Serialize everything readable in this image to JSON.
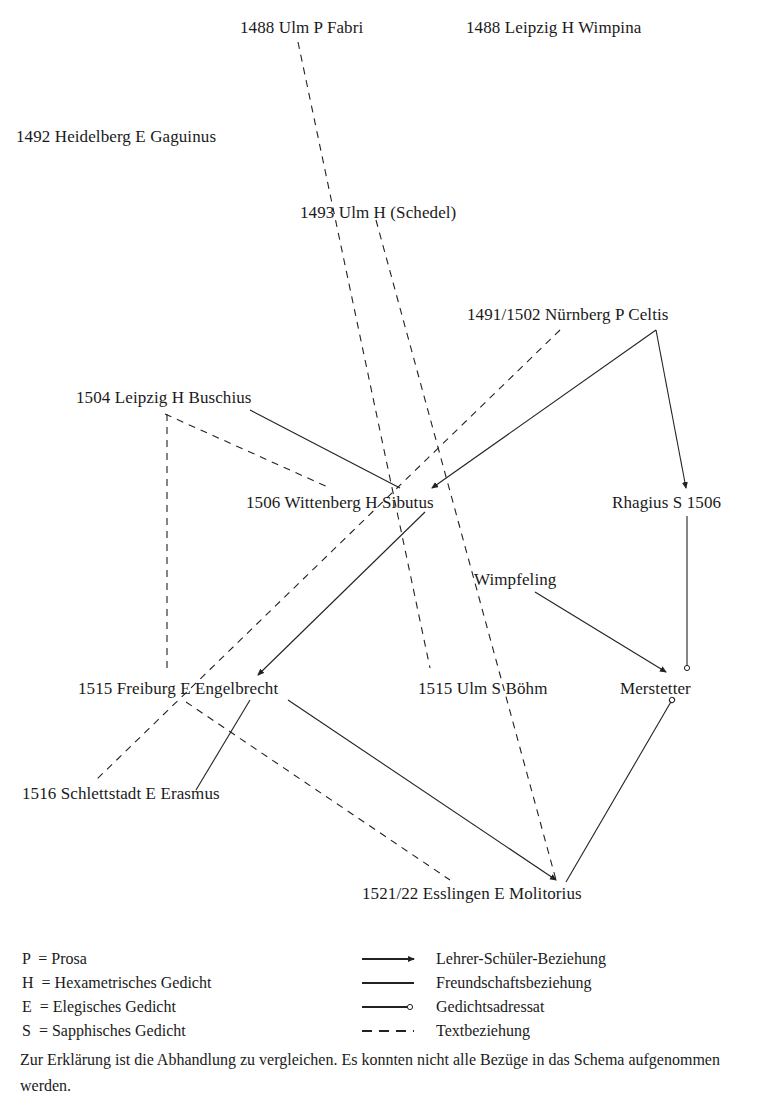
{
  "nodes": [
    {
      "id": "fabri",
      "label": "1488 Ulm P Fabri",
      "x": 240,
      "y": 18
    },
    {
      "id": "wimpina",
      "label": "1488 Leipzig H Wimpina",
      "x": 466,
      "y": 18
    },
    {
      "id": "gaguinus",
      "label": "1492 Heidelberg E Gaguinus",
      "x": 16,
      "y": 127
    },
    {
      "id": "schedel",
      "label": "1493 Ulm H (Schedel)",
      "x": 300,
      "y": 203
    },
    {
      "id": "celtis",
      "label": "1491/1502 Nürnberg P Celtis",
      "x": 467,
      "y": 305
    },
    {
      "id": "buschius",
      "label": "1504 Leipzig H Buschius",
      "x": 76,
      "y": 388
    },
    {
      "id": "sibutus",
      "label": "1506 Wittenberg H Sibutus",
      "x": 246,
      "y": 493
    },
    {
      "id": "rhagius",
      "label": "Rhagius S 1506",
      "x": 612,
      "y": 493
    },
    {
      "id": "wimpfeling",
      "label": "Wimpfeling",
      "x": 474,
      "y": 570
    },
    {
      "id": "engelbrecht",
      "label": "1515 Freiburg E Engelbrecht",
      "x": 78,
      "y": 679
    },
    {
      "id": "boehm",
      "label": "1515 Ulm S Böhm",
      "x": 418,
      "y": 679
    },
    {
      "id": "merstetter",
      "label": "Merstetter",
      "x": 620,
      "y": 679
    },
    {
      "id": "erasmus",
      "label": "1516 Schlettstadt E Erasmus",
      "x": 22,
      "y": 784
    },
    {
      "id": "molitorius",
      "label": "1521/22 Esslingen E Molitorius",
      "x": 362,
      "y": 884
    }
  ],
  "edges": [
    {
      "from": "fabri",
      "to": "boehm",
      "type": "text",
      "points": [
        [
          298,
          42
        ],
        [
          430,
          668
        ]
      ]
    },
    {
      "from": "schedel",
      "to": "molitorius",
      "type": "text",
      "points": [
        [
          376,
          220
        ],
        [
          556,
          880
        ]
      ]
    },
    {
      "from": "celtis",
      "to": "erasmus",
      "type": "text",
      "points": [
        [
          560,
          330
        ],
        [
          96,
          780
        ]
      ]
    },
    {
      "from": "celtis",
      "to": "sibutus",
      "type": "teacher",
      "points": [
        [
          656,
          330
        ],
        [
          432,
          488
        ]
      ]
    },
    {
      "from": "celtis",
      "to": "rhagius",
      "type": "teacher",
      "points": [
        [
          656,
          330
        ],
        [
          686,
          488
        ]
      ]
    },
    {
      "from": "buschius",
      "to": "sibutus",
      "type": "friend",
      "points": [
        [
          250,
          410
        ],
        [
          400,
          488
        ]
      ]
    },
    {
      "from": "buschius",
      "to": "sibutus-text",
      "type": "text",
      "points": [
        [
          165,
          414
        ],
        [
          330,
          488
        ]
      ]
    },
    {
      "from": "buschius",
      "to": "engelbrecht",
      "type": "text",
      "points": [
        [
          167,
          414
        ],
        [
          167,
          672
        ]
      ]
    },
    {
      "from": "sibutus",
      "to": "engelbrecht",
      "type": "teacher",
      "points": [
        [
          425,
          512
        ],
        [
          258,
          675
        ]
      ]
    },
    {
      "from": "rhagius",
      "to": "merstetter",
      "type": "addressee",
      "points": [
        [
          687,
          516
        ],
        [
          687,
          668
        ]
      ]
    },
    {
      "from": "wimpfeling",
      "to": "merstetter",
      "type": "teacher",
      "points": [
        [
          535,
          592
        ],
        [
          666,
          672
        ]
      ]
    },
    {
      "from": "engelbrecht",
      "to": "erasmus",
      "type": "friend",
      "points": [
        [
          250,
          700
        ],
        [
          196,
          790
        ]
      ]
    },
    {
      "from": "engelbrecht",
      "to": "molitorius-text",
      "type": "text",
      "points": [
        [
          186,
          702
        ],
        [
          450,
          880
        ]
      ]
    },
    {
      "from": "engelbrecht",
      "to": "molitorius",
      "type": "teacher",
      "points": [
        [
          288,
          700
        ],
        [
          556,
          880
        ]
      ]
    },
    {
      "from": "merstetter",
      "to": "molitorius",
      "type": "addressee",
      "points": [
        [
          672,
          700
        ],
        [
          566,
          882
        ]
      ]
    }
  ],
  "legend": {
    "abbreviations": [
      {
        "label": "P  = Prosa"
      },
      {
        "label": "H  = Hexametrisches Gedicht"
      },
      {
        "label": "E  = Elegisches Gedicht"
      },
      {
        "label": "S  = Sapphisches Gedicht"
      }
    ],
    "relations": [
      {
        "type": "teacher",
        "label": "Lehrer-Schüler-Beziehung"
      },
      {
        "type": "friend",
        "label": "Freundschaftsbeziehung"
      },
      {
        "type": "addressee",
        "label": "Gedichtsadressat"
      },
      {
        "type": "text",
        "label": "Textbeziehung"
      }
    ]
  },
  "note": "Zur Erklärung ist die Abhandlung zu vergleichen. Es konnten nicht alle Bezüge in das Schema aufgenommen werden.",
  "colors": {
    "line": "#222222",
    "text": "#1a1a1a",
    "background": "#ffffff"
  }
}
